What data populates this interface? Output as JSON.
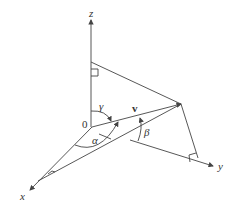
{
  "diagram": {
    "labels": {
      "z_axis": "z",
      "x_axis": "x",
      "y_axis": "y",
      "origin": "0",
      "vector": "v",
      "alpha": "α",
      "beta": "β",
      "gamma": "γ"
    },
    "colors": {
      "line": "#444444",
      "text": "#333333",
      "background": "#ffffff"
    }
  }
}
